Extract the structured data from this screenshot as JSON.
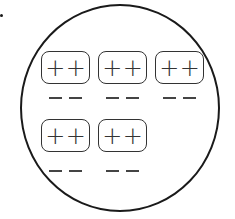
{
  "diagram": {
    "colors": {
      "stroke": "#1a1a1a",
      "background": "#ffffff"
    },
    "rows": [
      {
        "groups": [
          {
            "positive": [
              "+",
              "+"
            ],
            "negative": [
              "−",
              "−"
            ]
          },
          {
            "positive": [
              "+",
              "+"
            ],
            "negative": [
              "−",
              "−"
            ]
          },
          {
            "positive": [
              "+",
              "+"
            ],
            "negative": [
              "−",
              "−"
            ]
          }
        ]
      },
      {
        "groups": [
          {
            "positive": [
              "+",
              "+"
            ],
            "negative": [
              "−",
              "−"
            ]
          },
          {
            "positive": [
              "+",
              "+"
            ],
            "negative": [
              "−",
              "−"
            ]
          }
        ]
      }
    ]
  }
}
